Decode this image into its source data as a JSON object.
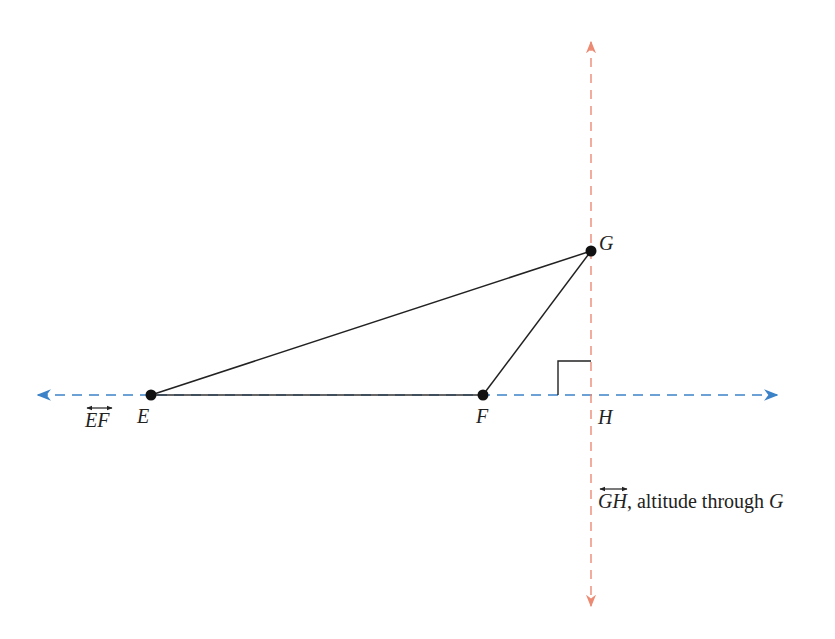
{
  "diagram": {
    "colors": {
      "line_ef": "#3b82c8",
      "altitude_gh": "#ec8a74",
      "triangle": "#222222",
      "points": "#111111"
    },
    "points": {
      "E": {
        "label": "E",
        "x": 151,
        "y": 395
      },
      "F": {
        "label": "F",
        "x": 483,
        "y": 395
      },
      "G": {
        "label": "G",
        "x": 591,
        "y": 251
      },
      "H": {
        "label": "H",
        "x": 591,
        "y": 395
      }
    },
    "lines": {
      "ef_line": {
        "label": "EF",
        "style": "dashed",
        "direction": "horizontal",
        "arrows": "both"
      },
      "gh_line": {
        "label": "GH",
        "caption_suffix": ", altitude through ",
        "caption_point": "G",
        "style": "dashed",
        "direction": "vertical",
        "arrows": "both"
      }
    },
    "right_angle_marker": {
      "at": "H",
      "size": 33
    },
    "segments": [
      "EG",
      "FG",
      "EF"
    ]
  }
}
